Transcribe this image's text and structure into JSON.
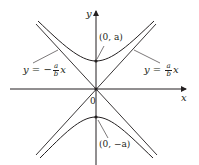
{
  "diagram": {
    "type": "hyperbola",
    "axes": {
      "x_label": "x",
      "y_label": "y",
      "origin_label": "0"
    },
    "vertices": {
      "top": "(0, a)",
      "bottom": "(0, −a)"
    },
    "asymptotes": {
      "left": {
        "prefix": "y = −",
        "num": "a",
        "den": "b",
        "suffix": "x"
      },
      "right": {
        "prefix": "y = ",
        "num": "a",
        "den": "b",
        "suffix": "x"
      }
    },
    "colors": {
      "ink": "#231f20",
      "background": "#ffffff"
    }
  }
}
